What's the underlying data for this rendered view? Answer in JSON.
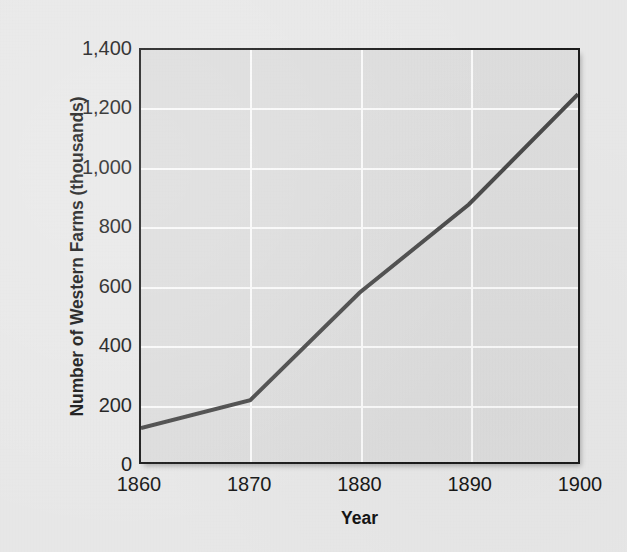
{
  "chart_data": {
    "type": "line",
    "title": "",
    "xlabel": "Year",
    "ylabel": "Number of Western Farms (thousands)",
    "x": [
      1860,
      1870,
      1880,
      1890,
      1900
    ],
    "values": [
      115,
      210,
      575,
      875,
      1250
    ],
    "series": [
      {
        "name": "Number of Western Farms",
        "values": [
          115,
          210,
          575,
          875,
          1250
        ]
      }
    ],
    "xlim": [
      1860,
      1900
    ],
    "ylim": [
      0,
      1400
    ],
    "x_tick_labels": [
      "1860",
      "1870",
      "1880",
      "1890",
      "1900"
    ],
    "y_tick_values": [
      0,
      200,
      400,
      600,
      800,
      1000,
      1200,
      1400
    ],
    "y_tick_labels": [
      "0",
      "200",
      "400",
      "600",
      "800",
      "1,000",
      "1,200",
      "1,400"
    ],
    "grid": true,
    "grid_color": "#fbfbfb",
    "legend": false,
    "legend_position": "none",
    "line_color": "#4a4a4a",
    "line_width": 4,
    "plot_background": "#dedede",
    "page_background": "#e9e9e9",
    "axis_color": "#1a1a1a",
    "text_color": "#171717"
  },
  "axes": {
    "y_title": "Number of Western Farms (thousands)",
    "x_title": "Year"
  }
}
